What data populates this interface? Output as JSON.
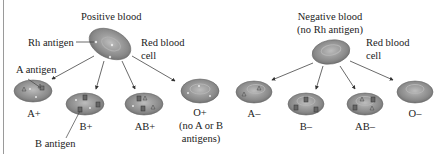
{
  "positive": {
    "title": "Positive blood",
    "rh_label": "Rh antigen",
    "rbc_label_1": "Red blood",
    "rbc_label_2": "cell",
    "a_antigen_label": "A antigen",
    "b_antigen_label": "B antigen",
    "types": [
      {
        "label": "A+"
      },
      {
        "label": "B+"
      },
      {
        "label": "AB+"
      },
      {
        "label": "O+",
        "note_1": "(no A or B",
        "note_2": "antigens)"
      }
    ]
  },
  "negative": {
    "title_1": "Negative blood",
    "title_2": "(no Rh antigen)",
    "rbc_label_1": "Red blood",
    "rbc_label_2": "cell",
    "types": [
      {
        "label": "A–"
      },
      {
        "label": "B–"
      },
      {
        "label": "AB–"
      },
      {
        "label": "O–"
      }
    ]
  },
  "colors": {
    "cell_fill": "#8d8d8d",
    "cell_center": "#b5b5b5",
    "cell_edge": "#5e5e5e",
    "text": "#222222",
    "line": "#444444"
  }
}
